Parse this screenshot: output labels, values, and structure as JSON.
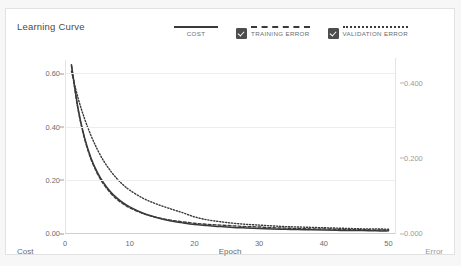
{
  "card": {
    "title": "Learning Curve"
  },
  "legend": {
    "items": [
      {
        "label": "COST",
        "style": "solid",
        "checkbox": false,
        "checked": false,
        "color": "#3a3a3a"
      },
      {
        "label": "TRAINING ERROR",
        "style": "dashed",
        "checkbox": true,
        "checked": true,
        "color": "#3a3a3a"
      },
      {
        "label": "VALIDATION ERROR",
        "style": "dotted",
        "checkbox": true,
        "checked": true,
        "color": "#3a3a3a"
      }
    ]
  },
  "axis_titles": {
    "left": "Cost",
    "bottom": "Epoch",
    "right": "Error"
  },
  "chart_data": {
    "type": "line",
    "title": "Learning Curve",
    "xlabel": "Epoch",
    "ylabel": "Cost",
    "y2label": "Error",
    "grid": true,
    "legend_position": "top-right",
    "xlim": [
      0,
      51
    ],
    "ylim": [
      0.0,
      0.65
    ],
    "y2lim": [
      0.0,
      0.46
    ],
    "xticks": [
      0,
      10,
      20,
      30,
      40,
      50
    ],
    "xtick_labels": [
      "0",
      "10",
      "20",
      "30",
      "40",
      "50"
    ],
    "yticks": [
      0.0,
      0.2,
      0.4,
      0.6
    ],
    "ytick_labels": [
      "0.00",
      "0.20",
      "0.40",
      "0.60"
    ],
    "y2ticks": [
      0.0,
      0.2,
      0.4
    ],
    "y2tick_labels": [
      "0.000",
      "0.200",
      "0.400"
    ],
    "x": [
      1,
      2,
      3,
      4,
      5,
      6,
      7,
      8,
      9,
      10,
      12,
      14,
      16,
      18,
      20,
      22,
      24,
      26,
      28,
      30,
      32,
      34,
      36,
      38,
      40,
      42,
      44,
      46,
      48,
      50
    ],
    "series": [
      {
        "name": "COST",
        "axis": "left",
        "style": "solid",
        "color": "#3a3a3a",
        "values": [
          0.632,
          0.47,
          0.36,
          0.283,
          0.228,
          0.187,
          0.156,
          0.132,
          0.113,
          0.098,
          0.075,
          0.059,
          0.047,
          0.039,
          0.032,
          0.028,
          0.024,
          0.021,
          0.019,
          0.017,
          0.015,
          0.014,
          0.013,
          0.012,
          0.011,
          0.01,
          0.009,
          0.009,
          0.008,
          0.008
        ]
      },
      {
        "name": "TRAINING ERROR",
        "axis": "right",
        "style": "dashed",
        "color": "#3a3a3a",
        "values": [
          0.445,
          0.33,
          0.252,
          0.197,
          0.158,
          0.129,
          0.107,
          0.09,
          0.077,
          0.067,
          0.052,
          0.042,
          0.035,
          0.03,
          0.026,
          0.023,
          0.021,
          0.019,
          0.017,
          0.016,
          0.014,
          0.013,
          0.012,
          0.011,
          0.011,
          0.01,
          0.009,
          0.009,
          0.008,
          0.008
        ]
      },
      {
        "name": "VALIDATION ERROR",
        "axis": "right",
        "style": "dotted",
        "color": "#3a3a3a",
        "values": [
          0.43,
          0.36,
          0.305,
          0.26,
          0.222,
          0.191,
          0.166,
          0.145,
          0.128,
          0.114,
          0.093,
          0.078,
          0.066,
          0.055,
          0.043,
          0.035,
          0.03,
          0.026,
          0.023,
          0.021,
          0.019,
          0.017,
          0.016,
          0.015,
          0.014,
          0.013,
          0.012,
          0.011,
          0.011,
          0.01
        ]
      }
    ]
  }
}
